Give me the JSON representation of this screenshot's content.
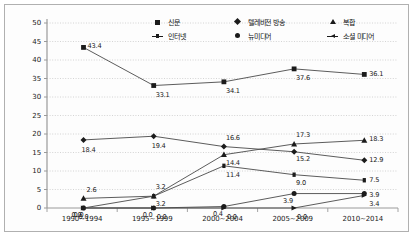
{
  "chart_data": {
    "type": "line",
    "title": "",
    "xlabel": "",
    "ylabel": "",
    "ylim": [
      0,
      50
    ],
    "yticks": [
      "0",
      "5",
      "10",
      "15",
      "20",
      "25",
      "30",
      "35",
      "40",
      "45",
      "50"
    ],
    "grid": true,
    "legend_position": "top-center",
    "categories": [
      "1990~1994",
      "1995~1999",
      "2000~2004",
      "2005~2009",
      "2010~2014"
    ],
    "series": [
      {
        "name": "신문",
        "marker": "square",
        "values": [
          43.4,
          33.1,
          34.1,
          37.6,
          36.1
        ],
        "labels": [
          "43.4",
          "33.1",
          "34.1",
          "37.6",
          "36.1"
        ]
      },
      {
        "name": "텔레비전 방송",
        "marker": "diamond",
        "values": [
          18.4,
          19.4,
          16.6,
          15.2,
          12.9
        ],
        "labels": [
          "18.4",
          "19.4",
          "16.6",
          "15.2",
          "12.9"
        ]
      },
      {
        "name": "복합",
        "marker": "triangle",
        "values": [
          2.6,
          3.2,
          14.4,
          17.3,
          18.3
        ],
        "labels": [
          "2.6",
          "3.2",
          "14.4",
          "17.3",
          "18.3"
        ]
      },
      {
        "name": "인터넷",
        "marker": "dash",
        "values": [
          0.0,
          3.2,
          11.4,
          9.0,
          7.5
        ],
        "labels": [
          "0.0",
          "3.2",
          "11.4",
          "9.0",
          "7.5"
        ]
      },
      {
        "name": "뉴미디어",
        "marker": "circle",
        "values": [
          0.0,
          0.0,
          0.4,
          3.9,
          3.9
        ],
        "labels": [
          "0.0",
          "0.0",
          "0.4",
          "3.9",
          "3.9"
        ]
      },
      {
        "name": "소셜 미디어",
        "marker": "dash-arrow",
        "values": [
          0.0,
          0.0,
          0.0,
          0.0,
          3.4
        ],
        "labels": [
          "0.0",
          "0.0",
          "0.0",
          "0.0",
          "3.4"
        ]
      }
    ]
  },
  "legend": {
    "items": [
      {
        "label": "신문",
        "marker": "square"
      },
      {
        "label": "텔레비전 방송",
        "marker": "diamond"
      },
      {
        "label": "복합",
        "marker": "triangle"
      },
      {
        "label": "인터넷",
        "marker": "dash"
      },
      {
        "label": "뉴미디어",
        "marker": "circle"
      },
      {
        "label": "소셜 미디어",
        "marker": "dash-arrow"
      }
    ]
  },
  "colors": {
    "line": "#4a4a4a",
    "marker": "#1b1b1b",
    "grid": "#c9c9c9",
    "axis": "#9a9a9a",
    "text": "#1a1a1a",
    "frame": "#b0b0b0"
  }
}
